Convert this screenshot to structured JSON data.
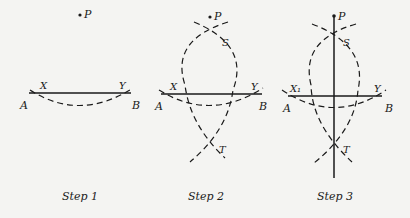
{
  "diagram": {
    "colors": {
      "ink": "#1a1a1a",
      "paper": "#f4f4f2"
    },
    "steps": [
      {
        "caption": "Step 1",
        "labels": {
          "P": "P",
          "X": "X",
          "Y": "Y",
          "A": "A",
          "B": "B"
        }
      },
      {
        "caption": "Step 2",
        "labels": {
          "P": "P",
          "S": "S",
          "T": "T",
          "X": "X",
          "Y": "Y",
          "A": "A",
          "B": "B"
        }
      },
      {
        "caption": "Step 3",
        "labels": {
          "P": "P",
          "S": "S",
          "T": "T",
          "X": "X₁",
          "Y": "Y",
          "A": "A",
          "B": "B"
        }
      }
    ]
  }
}
